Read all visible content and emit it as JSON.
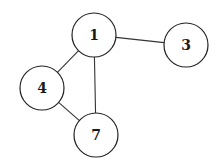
{
  "graph": {
    "nodes": [
      {
        "id": "1",
        "label": "1",
        "x": 94,
        "y": 35,
        "r": 22
      },
      {
        "id": "3",
        "label": "3",
        "x": 186,
        "y": 45,
        "r": 22
      },
      {
        "id": "4",
        "label": "4",
        "x": 42,
        "y": 88,
        "r": 22
      },
      {
        "id": "7",
        "label": "7",
        "x": 96,
        "y": 135,
        "r": 22
      }
    ],
    "edges": [
      {
        "from": "1",
        "to": "3"
      },
      {
        "from": "1",
        "to": "4"
      },
      {
        "from": "1",
        "to": "7"
      },
      {
        "from": "4",
        "to": "7"
      }
    ]
  }
}
